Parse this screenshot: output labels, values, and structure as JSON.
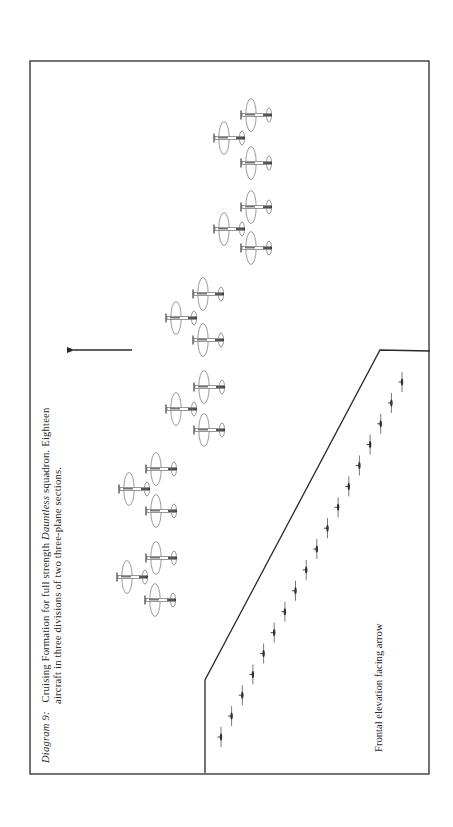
{
  "figure": {
    "number_label": "Diagram 9:",
    "caption_line1_parts": [
      {
        "text": "Cruising Formation for full strength ",
        "italic": false
      },
      {
        "text": "Dauntless",
        "italic": true
      },
      {
        "text": " squadron. Eighteen",
        "italic": false
      }
    ],
    "caption_line2": "aircraft in three divisions of two three-plane sections.",
    "elevation_label": "Frontal elevation facing arrow",
    "direction_arrow": {
      "x1": 132,
      "y1": 350,
      "x2": 68,
      "y2": 350,
      "direction": "left"
    },
    "colors": {
      "ink": "#2a2a2a",
      "plane_ink": "#555555",
      "background": "#ffffff"
    }
  },
  "frame": {
    "outer": {
      "x": 30,
      "y": 61,
      "width": 399,
      "height": 713
    },
    "inner_panel_points": [
      [
        430,
        351
      ],
      [
        380,
        350
      ],
      [
        205,
        680
      ],
      [
        205,
        773
      ]
    ]
  },
  "formation": {
    "divisions": [
      {
        "name": "Division 1",
        "sections": [
          {
            "planes": [
              [
                241,
                115
              ],
              [
                214,
                138
              ],
              [
                241,
                163
              ]
            ]
          },
          {
            "planes": [
              [
                241,
                207
              ],
              [
                214,
                229
              ],
              [
                241,
                248
              ]
            ]
          }
        ]
      },
      {
        "name": "Division 2",
        "sections": [
          {
            "planes": [
              [
                193,
                294
              ],
              [
                166,
                318
              ],
              [
                193,
                340
              ]
            ]
          },
          {
            "planes": [
              [
                194,
                387
              ],
              [
                166,
                409
              ],
              [
                194,
                430
              ]
            ]
          }
        ]
      },
      {
        "name": "Division 3",
        "sections": [
          {
            "planes": [
              [
                146,
                469
              ],
              [
                119,
                489
              ],
              [
                146,
                511
              ]
            ]
          },
          {
            "planes": [
              [
                146,
                558
              ],
              [
                117,
                577
              ],
              [
                145,
                600
              ]
            ]
          }
        ]
      }
    ]
  },
  "frontal_elevation": {
    "count": 18,
    "start": [
      221,
      737
    ],
    "end": [
      402,
      382
    ]
  }
}
